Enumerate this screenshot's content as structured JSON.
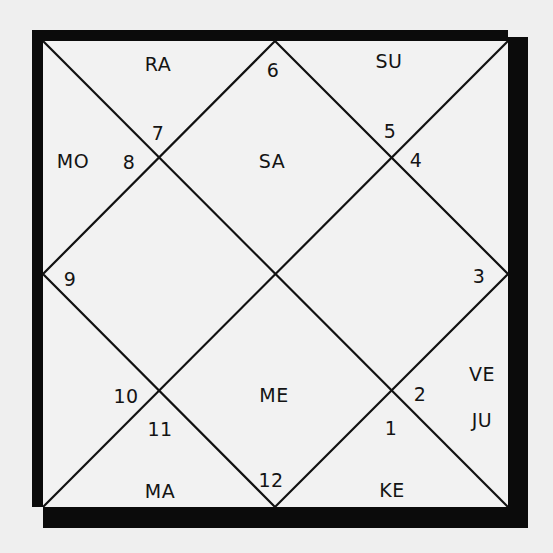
{
  "chart": {
    "type": "north-indian-birth-chart",
    "colors": {
      "ink": "#0b0b0b",
      "paper": "#efefef"
    },
    "houses": [
      {
        "house": "1",
        "planets": []
      },
      {
        "house": "2",
        "planets": [
          "VE",
          "JU"
        ]
      },
      {
        "house": "3",
        "planets": []
      },
      {
        "house": "4",
        "planets": []
      },
      {
        "house": "5",
        "planets": [
          "SU"
        ]
      },
      {
        "house": "6",
        "planets": [
          "SA"
        ]
      },
      {
        "house": "7",
        "planets": [
          "RA"
        ]
      },
      {
        "house": "8",
        "planets": [
          "MO"
        ]
      },
      {
        "house": "9",
        "planets": []
      },
      {
        "house": "10",
        "planets": []
      },
      {
        "house": "11",
        "planets": [
          "MA"
        ]
      },
      {
        "house": "12",
        "planets": [
          "ME",
          "KE"
        ]
      }
    ],
    "sign_numbers": {
      "n1": "1",
      "n2": "2",
      "n3": "3",
      "n4": "4",
      "n5": "5",
      "n6": "6",
      "n7": "7",
      "n8": "8",
      "n9": "9",
      "n10": "10",
      "n11": "11",
      "n12": "12"
    },
    "planet_labels": {
      "ra": "RA",
      "su": "SU",
      "mo": "MO",
      "sa": "SA",
      "me": "ME",
      "ve": "VE",
      "ju": "JU",
      "ma": "MA",
      "ke": "KE"
    }
  }
}
